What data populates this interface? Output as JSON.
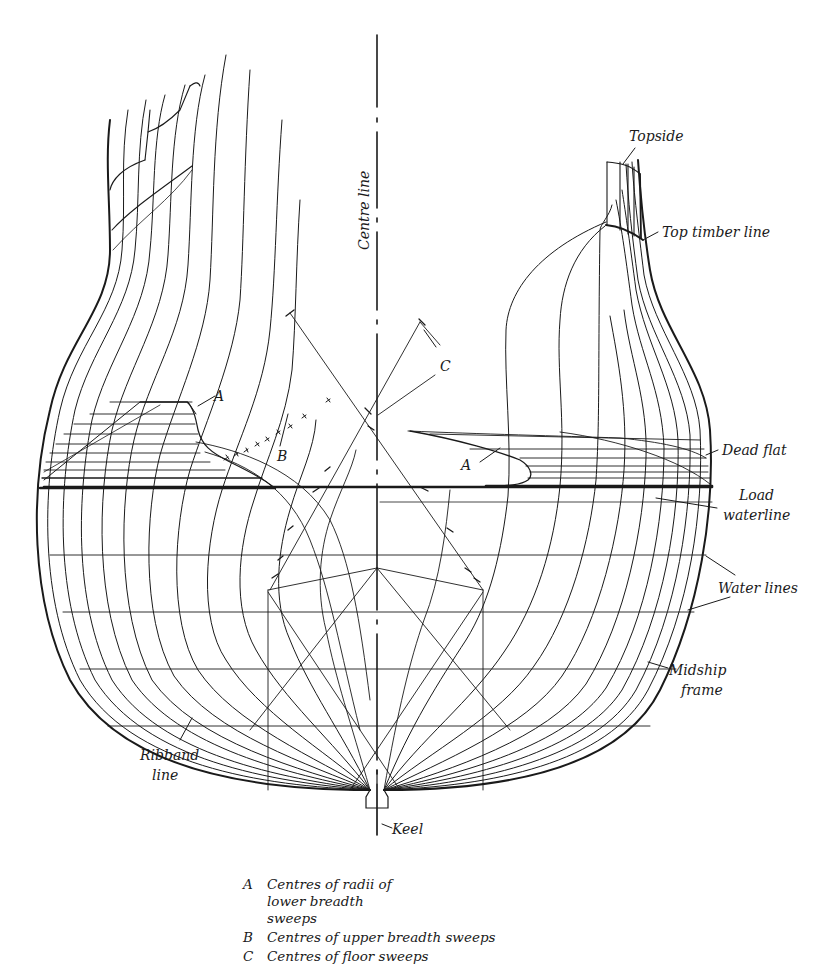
{
  "diagram": {
    "type": "ship body plan (half-breadth sections)",
    "labels": {
      "topside": "Topside",
      "top_timber_line": "Top timber line",
      "centre_line": "Centre line",
      "dead_flat": "Dead flat",
      "load_waterline_1": "Load",
      "load_waterline_2": "waterline",
      "water_lines": "Water lines",
      "midship_frame_1": "Midship",
      "midship_frame_2": "frame",
      "ribband_line_1": "Ribband",
      "ribband_line_2": "line",
      "keel": "Keel",
      "a_left": "A",
      "a_right": "A",
      "b": "B",
      "c": "C"
    },
    "legend": [
      {
        "key": "A",
        "text": "Centres of radii of lower breadth sweeps"
      },
      {
        "key": "B",
        "text": "Centres of upper breadth sweeps"
      },
      {
        "key": "C",
        "text": "Centres of floor sweeps"
      }
    ],
    "colors": {
      "ink": "#1a1a1a",
      "paper": "#ffffff"
    }
  }
}
